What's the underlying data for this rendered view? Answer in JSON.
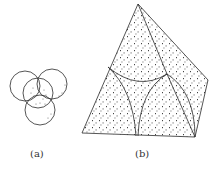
{
  "figure": {
    "panels": [
      {
        "id": "a",
        "label": "(a)",
        "description": "Four overlapping circles with stippled lens-shaped intersection regions"
      },
      {
        "id": "b",
        "label": "(b)",
        "description": "Tetrahedron with stippled faces partitioned by curved arcs meeting at a junction"
      }
    ]
  },
  "colors": {
    "line": "#2a2a2a",
    "stipple": "#3a3a3a",
    "background": "#ffffff"
  }
}
